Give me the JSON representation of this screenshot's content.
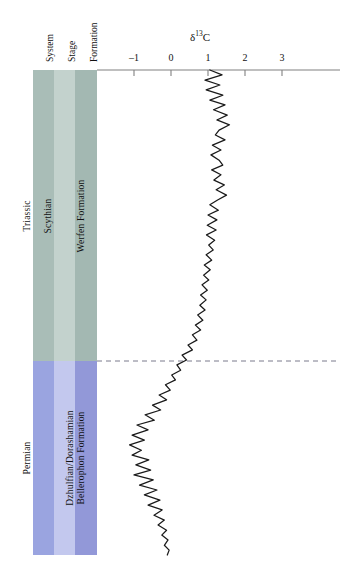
{
  "figure": {
    "background_color": "#ffffff",
    "curve_color": "#1a1a1a",
    "axis_color": "#808080",
    "boundary_line_color": "#7a7a8c"
  },
  "headers": [
    {
      "label": "System",
      "name": "column-header-system"
    },
    {
      "label": "Stage",
      "name": "column-header-stage"
    },
    {
      "label": "Formation",
      "name": "column-header-formation"
    }
  ],
  "strat_columns": [
    {
      "name": "system-column",
      "label_upper": "Triassic",
      "label_lower": "Permian",
      "color_upper": "#a9bdb7",
      "color_lower": "#9aa4e0"
    },
    {
      "name": "stage-column",
      "label_upper": "Scythian",
      "label_lower": "Dzhulfian/Dorashamian",
      "color_upper": "#c3d2cd",
      "color_lower": "#c3c8ee"
    },
    {
      "name": "formation-column",
      "label_upper": "Werfen Formation",
      "label_lower": "Bellerophon Formation",
      "color_upper": "#a3b8b2",
      "color_lower": "#9298d8"
    }
  ],
  "chart_data": {
    "type": "line",
    "title": "δ",
    "title_superscript": "13",
    "title_element": "C",
    "xlabel": "δ13C",
    "ylabel": "",
    "orientation": "vertical-stratigraphic",
    "xlim": [
      -1.65,
      3.65
    ],
    "grid": false,
    "legend": false,
    "xticks": [
      -1,
      0,
      1,
      2,
      3
    ],
    "xtick_labels": [
      "–1",
      "0",
      "1",
      "2",
      "3"
    ],
    "annotations": [
      {
        "name": "permian-triassic-boundary",
        "type": "horizontal-dashed-line",
        "depth_fraction": 0.6
      }
    ],
    "series": [
      {
        "name": "δ13C",
        "description": "Carbon isotope curve plotted against stratigraphic height; x = delta13C per mil, y = depth fraction from top (0) to base (1)",
        "points": [
          [
            1.05,
            0.0
          ],
          [
            1.38,
            0.01
          ],
          [
            0.92,
            0.021
          ],
          [
            1.32,
            0.031
          ],
          [
            0.95,
            0.041
          ],
          [
            1.4,
            0.052
          ],
          [
            1.05,
            0.062
          ],
          [
            1.46,
            0.072
          ],
          [
            1.15,
            0.082
          ],
          [
            1.52,
            0.093
          ],
          [
            1.24,
            0.103
          ],
          [
            1.58,
            0.113
          ],
          [
            1.3,
            0.124
          ],
          [
            1.2,
            0.134
          ],
          [
            1.46,
            0.144
          ],
          [
            1.12,
            0.155
          ],
          [
            1.35,
            0.165
          ],
          [
            1.08,
            0.175
          ],
          [
            1.3,
            0.186
          ],
          [
            1.4,
            0.196
          ],
          [
            1.1,
            0.206
          ],
          [
            1.35,
            0.216
          ],
          [
            1.16,
            0.227
          ],
          [
            1.44,
            0.237
          ],
          [
            1.22,
            0.247
          ],
          [
            1.5,
            0.258
          ],
          [
            1.26,
            0.268
          ],
          [
            1.05,
            0.278
          ],
          [
            1.28,
            0.289
          ],
          [
            1.0,
            0.299
          ],
          [
            1.24,
            0.309
          ],
          [
            0.98,
            0.32
          ],
          [
            1.22,
            0.33
          ],
          [
            0.96,
            0.34
          ],
          [
            1.18,
            0.351
          ],
          [
            1.02,
            0.361
          ],
          [
            1.14,
            0.371
          ],
          [
            0.95,
            0.381
          ],
          [
            1.1,
            0.392
          ],
          [
            0.9,
            0.402
          ],
          [
            1.06,
            0.412
          ],
          [
            0.88,
            0.423
          ],
          [
            1.02,
            0.433
          ],
          [
            0.84,
            0.443
          ],
          [
            0.98,
            0.454
          ],
          [
            0.8,
            0.464
          ],
          [
            0.95,
            0.474
          ],
          [
            0.78,
            0.485
          ],
          [
            0.92,
            0.495
          ],
          [
            0.72,
            0.505
          ],
          [
            0.86,
            0.516
          ],
          [
            0.66,
            0.526
          ],
          [
            0.8,
            0.536
          ],
          [
            0.58,
            0.546
          ],
          [
            0.7,
            0.557
          ],
          [
            0.46,
            0.567
          ],
          [
            0.58,
            0.577
          ],
          [
            0.3,
            0.588
          ],
          [
            0.42,
            0.598
          ],
          [
            0.16,
            0.608
          ],
          [
            0.26,
            0.619
          ],
          [
            0.02,
            0.629
          ],
          [
            0.12,
            0.639
          ],
          [
            -0.15,
            0.649
          ],
          [
            -0.02,
            0.66
          ],
          [
            -0.32,
            0.67
          ],
          [
            -0.12,
            0.68
          ],
          [
            -0.5,
            0.691
          ],
          [
            -0.28,
            0.701
          ],
          [
            -0.7,
            0.711
          ],
          [
            -0.45,
            0.722
          ],
          [
            -0.92,
            0.732
          ],
          [
            -0.62,
            0.742
          ],
          [
            -1.05,
            0.753
          ],
          [
            -0.72,
            0.763
          ],
          [
            -1.12,
            0.773
          ],
          [
            -0.8,
            0.784
          ],
          [
            -1.05,
            0.794
          ],
          [
            -0.6,
            0.804
          ],
          [
            -0.95,
            0.814
          ],
          [
            -0.55,
            0.825
          ],
          [
            -1.0,
            0.835
          ],
          [
            -0.48,
            0.845
          ],
          [
            -0.85,
            0.856
          ],
          [
            -0.38,
            0.866
          ],
          [
            -0.72,
            0.876
          ],
          [
            -0.3,
            0.887
          ],
          [
            -0.62,
            0.897
          ],
          [
            -0.24,
            0.907
          ],
          [
            -0.46,
            0.918
          ],
          [
            -0.18,
            0.928
          ],
          [
            -0.35,
            0.938
          ],
          [
            -0.12,
            0.949
          ],
          [
            -0.25,
            0.959
          ],
          [
            -0.08,
            0.969
          ],
          [
            -0.18,
            0.98
          ],
          [
            -0.05,
            0.99
          ],
          [
            -0.1,
            1.0
          ]
        ]
      }
    ],
    "value_range_description": {
      "upper_triassic_mean": 1.2,
      "negative_excursion_minimum": -1.4,
      "permian_basal_maximum": 3.2
    }
  }
}
